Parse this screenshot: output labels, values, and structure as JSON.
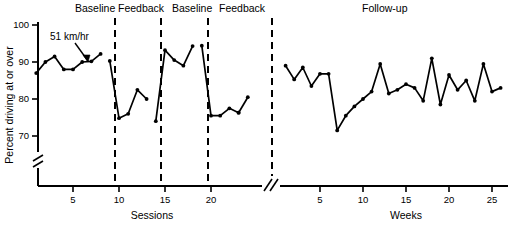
{
  "chart_data": {
    "type": "line",
    "title": "",
    "subtitle": "",
    "ylabel": "Percent driving at or over",
    "annotation": "51 km/hr",
    "grid": false,
    "legend": "none",
    "axis_breaks": {
      "y": true,
      "x": true
    },
    "panels": [
      {
        "name": "sessions",
        "xlabel": "Sessions",
        "xlim": [
          0,
          24
        ],
        "xticks": [
          5,
          10,
          15,
          20
        ],
        "xticklabels": [
          "5",
          "10",
          "15",
          "20"
        ],
        "ylim": [
          65,
          100
        ],
        "yticks": [
          70,
          80,
          90,
          100
        ],
        "yticklabels": [
          "70",
          "80",
          "90",
          "100"
        ],
        "phase_dividers": [
          8.5,
          13.5,
          18.5,
          23.2
        ],
        "phases": [
          {
            "label": "Baseline",
            "x": 4.0
          },
          {
            "label": "Feedback",
            "x": 11.0
          },
          {
            "label": "Baseline",
            "x": 16.0
          },
          {
            "label": "Feedback",
            "x": 20.8
          }
        ],
        "series": [
          {
            "name": "Baseline 1",
            "x": [
              1,
              2,
              3,
              4,
              5,
              6,
              7,
              8
            ],
            "values": [
              87.0,
              90.0,
              91.5,
              88.0,
              88.0,
              90.0,
              90.2,
              92.2
            ]
          },
          {
            "name": "Feedback 1",
            "x": [
              9,
              10,
              11,
              12,
              13
            ],
            "values": [
              90.3,
              74.8,
              76.0,
              82.5,
              80.0
            ]
          },
          {
            "name": "Baseline 2",
            "x": [
              14,
              15,
              16,
              17,
              18
            ],
            "values": [
              74.0,
              93.2,
              90.5,
              89.0,
              94.3
            ]
          },
          {
            "name": "Feedback 2",
            "x": [
              19,
              20,
              21,
              22,
              23
            ],
            "values": [
              94.4,
              75.5,
              75.5,
              77.5,
              76.3
            ]
          },
          {
            "name": "Feedback 2 tail",
            "x": [
              23,
              24
            ],
            "values": [
              76.3,
              80.5
            ]
          }
        ]
      },
      {
        "name": "follow-up",
        "xlabel": "Weeks",
        "xlim": [
          0,
          27
        ],
        "xticks": [
          5,
          10,
          15,
          20,
          25
        ],
        "xticklabels": [
          "5",
          "10",
          "15",
          "20",
          "25"
        ],
        "phases": [
          {
            "label": "Follow-up",
            "x": 13.5
          }
        ],
        "series": [
          {
            "name": "Follow-up",
            "x": [
              1,
              2,
              3,
              4,
              5,
              6,
              7,
              8,
              9,
              10,
              11,
              12,
              13,
              14,
              15,
              16,
              17,
              18,
              19,
              20,
              21,
              22,
              23,
              24,
              25,
              26
            ],
            "values": [
              89.0,
              85.3,
              88.5,
              83.5,
              86.8,
              86.8,
              71.5,
              75.5,
              78.0,
              80.0,
              82.0,
              89.5,
              81.5,
              82.5,
              84.0,
              83.0,
              79.5,
              91.0,
              78.5,
              86.5,
              82.5,
              85.0,
              79.5,
              89.5,
              82.0,
              83.0
            ]
          }
        ]
      }
    ]
  }
}
